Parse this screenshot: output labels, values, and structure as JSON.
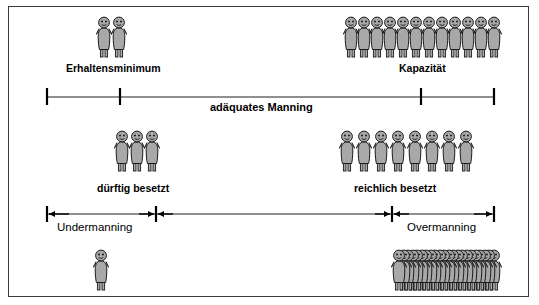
{
  "diagram": {
    "title_present": false,
    "background_color": "#ffffff",
    "border_color": "#3a3a3a",
    "figure_fill": "#a8a8a8",
    "figure_stroke": "#1a1a1a",
    "axis_color": "#6a6a6a",
    "tick_color": "#000000"
  },
  "groups": [
    {
      "id": "erhaltensminimum-group",
      "label": "Erhaltensminimum",
      "count": 2,
      "size": "normal",
      "icon": "person-figure-icon"
    },
    {
      "id": "kapazitaet-group",
      "label": "Kapazität",
      "count": 12,
      "size": "normal",
      "icon": "person-figure-icon"
    },
    {
      "id": "duerftig-besetzt-group",
      "label": "dürftig besetzt",
      "count": 3,
      "size": "normal",
      "icon": "person-figure-icon"
    },
    {
      "id": "reichlich-besetzt-group",
      "label": "reichlich besetzt",
      "count": 8,
      "size": "normal",
      "icon": "person-figure-icon"
    },
    {
      "id": "undermanning-group",
      "label": "",
      "count": 1,
      "size": "normal",
      "icon": "person-figure-icon"
    },
    {
      "id": "overmanning-group",
      "label": "",
      "count": 22,
      "size": "dense",
      "icon": "person-figure-icon"
    }
  ],
  "axes": {
    "top": {
      "id": "adaequates-manning-axis",
      "label": "adäquates  Manning",
      "ticks": 4,
      "style": "plain-ticks"
    },
    "bottom": {
      "id": "manning-range-axis",
      "left_label": "Undermanning",
      "right_label": "Overmanning",
      "style": "double-arrow-ticks"
    }
  },
  "labels": {
    "erhaltensminimum": "Erhaltensminimum",
    "kapazitaet": "Kapazität",
    "adaequates_manning": "adäquates  Manning",
    "duerftig_besetzt": "dürftig besetzt",
    "reichlich_besetzt": "reichlich besetzt",
    "undermanning": "Undermanning",
    "overmanning": "Overmanning"
  }
}
